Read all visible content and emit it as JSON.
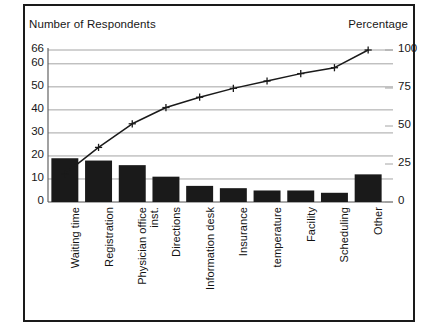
{
  "chart_data": {
    "type": "bar",
    "title": "",
    "subtitle": "",
    "ylabel": "Number of Respondents",
    "ylabel_right": "Percentage",
    "xlabel": "",
    "grid": true,
    "legend": "none",
    "ylim": [
      0,
      66
    ],
    "ylim_right": [
      0,
      100
    ],
    "yticks": [
      "66",
      "60",
      "50",
      "40",
      "30",
      "20",
      "10",
      "0"
    ],
    "ytick_values": [
      66,
      60,
      50,
      40,
      30,
      20,
      10,
      0
    ],
    "yticks_right": [
      "100",
      "75",
      "50",
      "25",
      "0"
    ],
    "ytick_values_right": [
      100,
      75,
      50,
      25,
      0
    ],
    "categories": [
      "Waiting time",
      "Registration",
      "Physician office inst.",
      "Directions",
      "Information desk",
      "Insurance",
      "temperature",
      "Facility",
      "Scheduling",
      "Other"
    ],
    "category_lines": [
      [
        "Waiting time",
        ""
      ],
      [
        "Registration",
        ""
      ],
      [
        "Physician office",
        "inst."
      ],
      [
        "Directions",
        ""
      ],
      [
        "Information desk",
        ""
      ],
      [
        "Insurance",
        ""
      ],
      [
        "temperature",
        ""
      ],
      [
        "Facility",
        ""
      ],
      [
        "Scheduling",
        ""
      ],
      [
        "Other",
        ""
      ]
    ],
    "series": [
      {
        "name": "Number of Respondents",
        "type": "bar",
        "color": "#1a1a1a",
        "values": [
          19,
          18,
          16,
          11,
          7,
          6,
          5,
          5,
          4,
          12
        ]
      },
      {
        "name": "Cumulative Percentage",
        "type": "line",
        "color": "#1a1a1a",
        "marker": "plus",
        "axis": "right",
        "values": [
          29,
          56,
          80,
          97,
          108,
          117,
          124,
          132,
          138,
          156
        ]
      }
    ],
    "colors": {
      "bar": "#1a1a1a",
      "line": "#1a1a1a",
      "grid": "#9a9a9a",
      "axis": "#555555",
      "frame": "#1a1a1a",
      "text": "#171717",
      "background": "#ffffff"
    }
  }
}
